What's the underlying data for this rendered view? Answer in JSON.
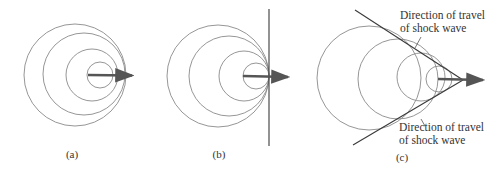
{
  "figure": {
    "panels": [
      {
        "id": "a",
        "label": "(a)",
        "description": "Source moving slower than wave speed"
      },
      {
        "id": "b",
        "label": "(b)",
        "description": "Source moving at wave speed"
      },
      {
        "id": "c",
        "label": "(c)",
        "description": "Source moving faster than wave speed (shock wave)"
      }
    ],
    "annotations": {
      "upper_line1": "Direction of travel",
      "upper_line2": "of shock wave",
      "lower_line1": "Direction of travel",
      "lower_line2": "of shock wave"
    },
    "colors": {
      "circle": "#8a8a8a",
      "arrow": "#555555",
      "shock_line": "#3a3a3a",
      "text": "#333333"
    }
  }
}
